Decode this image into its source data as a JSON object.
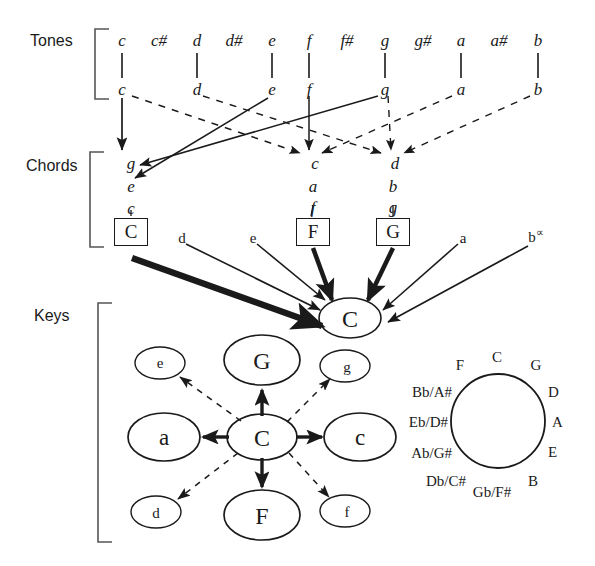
{
  "diagram": {
    "stroke_color": "#1a1a1a",
    "background": "#ffffff"
  },
  "sections": {
    "tones_label": "Tones",
    "chords_label": "Chords",
    "keys_label": "Keys"
  },
  "tones": {
    "chromatic_row": [
      {
        "name": "c",
        "x": 122,
        "natural": true
      },
      {
        "name": "c#",
        "x": 159,
        "natural": false
      },
      {
        "name": "d",
        "x": 197,
        "natural": true
      },
      {
        "name": "d#",
        "x": 234,
        "natural": false
      },
      {
        "name": "e",
        "x": 272,
        "natural": true
      },
      {
        "name": "f",
        "x": 309,
        "natural": true
      },
      {
        "name": "f#",
        "x": 347,
        "natural": false
      },
      {
        "name": "g",
        "x": 385,
        "natural": true
      },
      {
        "name": "g#",
        "x": 423,
        "natural": false
      },
      {
        "name": "a",
        "x": 461,
        "natural": true
      },
      {
        "name": "a#",
        "x": 499,
        "natural": false
      },
      {
        "name": "b",
        "x": 538,
        "natural": true
      }
    ],
    "natural_row": [
      {
        "name": "c",
        "x": 122
      },
      {
        "name": "d",
        "x": 197
      },
      {
        "name": "e",
        "x": 272
      },
      {
        "name": "f",
        "x": 309
      },
      {
        "name": "g",
        "x": 385
      },
      {
        "name": "a",
        "x": 461
      },
      {
        "name": "b",
        "x": 538
      }
    ]
  },
  "chords": {
    "stacks": [
      {
        "symbol": "C",
        "x": 131,
        "notes": [
          "g",
          "e",
          "c"
        ]
      },
      {
        "symbol": "F",
        "x": 313,
        "notes": [
          "c",
          "a",
          "f"
        ]
      },
      {
        "symbol": "G",
        "x": 393,
        "notes": [
          "d",
          "b",
          "g"
        ]
      }
    ],
    "free_labels": [
      {
        "text": "d",
        "sup": "",
        "x": 182,
        "y": 238
      },
      {
        "text": "e",
        "sup": "",
        "x": 253,
        "y": 238
      },
      {
        "text": "a",
        "sup": "",
        "x": 463,
        "y": 238
      },
      {
        "text": "b",
        "sup": "∝",
        "x": 536,
        "y": 233
      }
    ]
  },
  "keys": {
    "target": {
      "label": "C",
      "cx": 350,
      "cy": 318,
      "rx": 31,
      "ry": 20
    },
    "network": {
      "center": {
        "label": "C",
        "cx": 262,
        "cy": 437,
        "rx": 35,
        "ry": 23
      },
      "nodes": [
        {
          "label": "G",
          "cx": 262,
          "cy": 360,
          "rx": 38,
          "ry": 25,
          "size": "major",
          "edge": "solid"
        },
        {
          "label": "F",
          "cx": 262,
          "cy": 515,
          "rx": 38,
          "ry": 25,
          "size": "major",
          "edge": "solid"
        },
        {
          "label": "a",
          "cx": 164,
          "cy": 437,
          "rx": 36,
          "ry": 24,
          "size": "minor-lg",
          "edge": "solid"
        },
        {
          "label": "c",
          "cx": 360,
          "cy": 437,
          "rx": 36,
          "ry": 24,
          "size": "minor-lg",
          "edge": "solid"
        },
        {
          "label": "e",
          "cx": 160,
          "cy": 363,
          "rx": 25,
          "ry": 16,
          "size": "minor-sm",
          "edge": "dashed"
        },
        {
          "label": "g",
          "cx": 345,
          "cy": 366,
          "rx": 25,
          "ry": 16,
          "size": "minor-sm",
          "edge": "dashed"
        },
        {
          "label": "d",
          "cx": 156,
          "cy": 512,
          "rx": 25,
          "ry": 16,
          "size": "minor-sm",
          "edge": "dashed"
        },
        {
          "label": "f",
          "cx": 345,
          "cy": 511,
          "rx": 25,
          "ry": 16,
          "size": "minor-sm",
          "edge": "dashed"
        }
      ]
    }
  },
  "circle_of_fifths": {
    "cx": 498,
    "cy": 421,
    "r": 47,
    "labels": [
      {
        "text": "C",
        "angle": -90,
        "align": "center",
        "dx": 0,
        "dy": -16
      },
      {
        "text": "G",
        "angle": -60,
        "align": "center",
        "dx": 12,
        "dy": -13
      },
      {
        "text": "D",
        "angle": -30,
        "align": "right",
        "dx": 6,
        "dy": -6
      },
      {
        "text": "A",
        "angle": 0,
        "align": "right",
        "dx": 8,
        "dy": 0
      },
      {
        "text": "E",
        "angle": 30,
        "align": "right",
        "dx": 6,
        "dy": 6
      },
      {
        "text": "B",
        "angle": 60,
        "align": "center",
        "dx": 12,
        "dy": 14
      },
      {
        "text": "Gb/F#",
        "angle": 90,
        "align": "center",
        "dx": 2,
        "dy": 22
      },
      {
        "text": "Db/C#",
        "angle": 120,
        "align": "right",
        "dx": -34,
        "dy": 16
      },
      {
        "text": "Ab/G#",
        "angle": 150,
        "align": "left",
        "dx": -6,
        "dy": 6
      },
      {
        "text": "Eb/D#",
        "angle": 180,
        "align": "left",
        "dx": -8,
        "dy": 0
      },
      {
        "text": "Bb/A#",
        "angle": 210,
        "align": "left",
        "dx": -6,
        "dy": -6
      },
      {
        "text": "F",
        "angle": 240,
        "align": "center",
        "dx": -14,
        "dy": -13
      }
    ]
  }
}
